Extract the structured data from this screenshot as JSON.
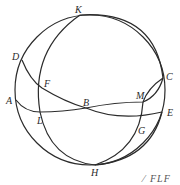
{
  "diagram": {
    "type": "spherical-geometry",
    "labels": {
      "K": "K",
      "D": "D",
      "F": "F",
      "C": "C",
      "A": "A",
      "B": "B",
      "M": "M",
      "E": "E",
      "L": "L",
      "G": "G",
      "H": "H"
    },
    "caption": "FLF",
    "caption_mark": "⁄",
    "colors": {
      "stroke": "#2b2b2b",
      "background": "#ffffff"
    }
  }
}
